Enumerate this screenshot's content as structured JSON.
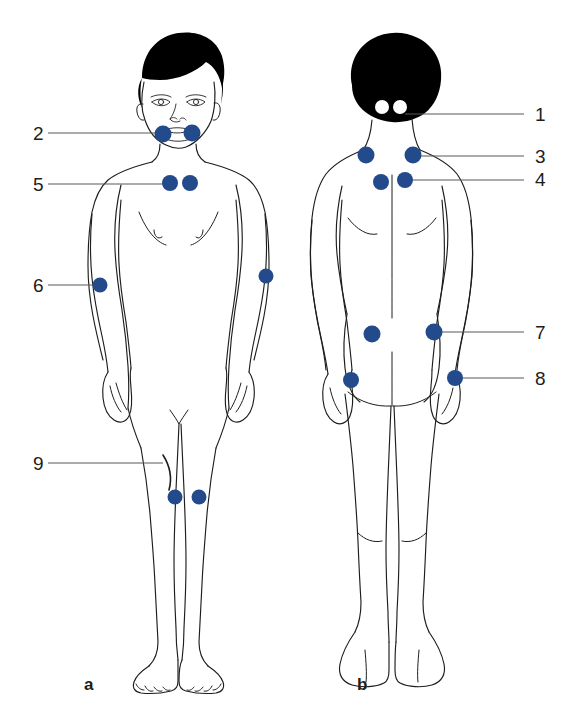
{
  "figure": {
    "dot_color": "#234a8a",
    "line_color": "#58585a",
    "outline_color": "#1d1d1b",
    "hair_color": "#000000",
    "background": "#ffffff"
  },
  "panels": [
    {
      "id": "panel-a",
      "letter": "a",
      "view": "anterior",
      "x": 84,
      "y": 690
    },
    {
      "id": "panel-b",
      "letter": "b",
      "view": "posterior",
      "x": 357,
      "y": 690
    }
  ],
  "labels": [
    {
      "id": "label-1",
      "text": "1",
      "view": "posterior",
      "text_x": 535,
      "text_y": 121,
      "line_x1": 405,
      "line_y1": 114,
      "line_x2": 524,
      "line_y2": 114
    },
    {
      "id": "label-2",
      "text": "2",
      "view": "anterior",
      "text_x": 33,
      "text_y": 140,
      "line_x1": 48,
      "line_y1": 133,
      "line_x2": 166,
      "line_y2": 133
    },
    {
      "id": "label-3",
      "text": "3",
      "view": "posterior",
      "text_x": 535,
      "text_y": 163,
      "line_x1": 412,
      "line_y1": 156,
      "line_x2": 524,
      "line_y2": 156
    },
    {
      "id": "label-4",
      "text": "4",
      "view": "posterior",
      "text_x": 535,
      "text_y": 186,
      "line_x1": 404,
      "line_y1": 180,
      "line_x2": 524,
      "line_y2": 180
    },
    {
      "id": "label-5",
      "text": "5",
      "view": "anterior",
      "text_x": 33,
      "text_y": 191,
      "line_x1": 48,
      "line_y1": 184,
      "line_x2": 172,
      "line_y2": 184
    },
    {
      "id": "label-6",
      "text": "6",
      "view": "anterior",
      "text_x": 33,
      "text_y": 292,
      "line_x1": 48,
      "line_y1": 285,
      "line_x2": 101,
      "line_y2": 285
    },
    {
      "id": "label-7",
      "text": "7",
      "view": "posterior",
      "text_x": 535,
      "text_y": 339,
      "line_x1": 434,
      "line_y1": 332,
      "line_x2": 524,
      "line_y2": 332
    },
    {
      "id": "label-8",
      "text": "8",
      "view": "posterior",
      "text_x": 535,
      "text_y": 385,
      "line_x1": 455,
      "line_y1": 378,
      "line_x2": 524,
      "line_y2": 378
    },
    {
      "id": "label-9",
      "text": "9",
      "view": "anterior",
      "text_x": 33,
      "text_y": 470,
      "line_x1": 48,
      "line_y1": 463,
      "line_x2": 163,
      "line_y2": 463
    }
  ],
  "tender_points": [
    {
      "id": "tp-2-left",
      "label": "2",
      "view": "anterior",
      "site": "low-cervical-left",
      "cx": 163,
      "cy": 134,
      "r": 8.5
    },
    {
      "id": "tp-2-right",
      "label": "2",
      "view": "anterior",
      "site": "low-cervical-right",
      "cx": 192,
      "cy": 133,
      "r": 8.5
    },
    {
      "id": "tp-5-left",
      "label": "5",
      "view": "anterior",
      "site": "second-rib-left",
      "cx": 170,
      "cy": 183,
      "r": 8.0
    },
    {
      "id": "tp-5-right",
      "label": "5",
      "view": "anterior",
      "site": "second-rib-right",
      "cx": 190,
      "cy": 183,
      "r": 8.0
    },
    {
      "id": "tp-6-left",
      "label": "6",
      "view": "anterior",
      "site": "lateral-epicondyle-left",
      "cx": 100,
      "cy": 285,
      "r": 7.5
    },
    {
      "id": "tp-6-right",
      "label": "6",
      "view": "anterior",
      "site": "lateral-epicondyle-right",
      "cx": 266,
      "cy": 276,
      "r": 7.5
    },
    {
      "id": "tp-9-left",
      "label": "9",
      "view": "anterior",
      "site": "medial-knee-left",
      "cx": 175,
      "cy": 497,
      "r": 7.5
    },
    {
      "id": "tp-9-right",
      "label": "9",
      "view": "anterior",
      "site": "medial-knee-right",
      "cx": 199,
      "cy": 497,
      "r": 7.5
    },
    {
      "id": "tp-3-left",
      "label": "3",
      "view": "posterior",
      "site": "trapezius-left",
      "cx": 366,
      "cy": 155,
      "r": 8.5
    },
    {
      "id": "tp-3-right",
      "label": "3",
      "view": "posterior",
      "site": "trapezius-right",
      "cx": 413,
      "cy": 155,
      "r": 8.5
    },
    {
      "id": "tp-4-left",
      "label": "4",
      "view": "posterior",
      "site": "supraspinatus-left",
      "cx": 381,
      "cy": 182,
      "r": 8.0
    },
    {
      "id": "tp-4-right",
      "label": "4",
      "view": "posterior",
      "site": "supraspinatus-right",
      "cx": 405,
      "cy": 180,
      "r": 8.0
    },
    {
      "id": "tp-7-left",
      "label": "7",
      "view": "posterior",
      "site": "gluteal-left",
      "cx": 372,
      "cy": 334,
      "r": 8.5
    },
    {
      "id": "tp-7-right",
      "label": "7",
      "view": "posterior",
      "site": "gluteal-right",
      "cx": 434,
      "cy": 332,
      "r": 8.5
    },
    {
      "id": "tp-8-left",
      "label": "8",
      "view": "posterior",
      "site": "greater-trochanter-left",
      "cx": 351,
      "cy": 380,
      "r": 8.0
    },
    {
      "id": "tp-8-right",
      "label": "8",
      "view": "posterior",
      "site": "greater-trochanter-right",
      "cx": 455,
      "cy": 378,
      "r": 8.0
    }
  ],
  "occiput_marks": [
    {
      "id": "occiput-left",
      "label": "1",
      "cx": 382,
      "cy": 107,
      "r": 7.0
    },
    {
      "id": "occiput-right",
      "label": "1",
      "cx": 400,
      "cy": 107,
      "r": 7.0
    }
  ]
}
